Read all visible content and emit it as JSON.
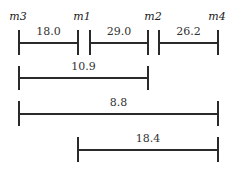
{
  "diagram": {
    "markers": [
      {
        "name": "m3",
        "x": 18
      },
      {
        "name": "m1",
        "x": 82
      },
      {
        "name": "m2",
        "x": 153
      },
      {
        "name": "m4",
        "x": 217
      }
    ],
    "intervals": [
      {
        "from": "m3",
        "to": "m1",
        "label": "18.0",
        "x1": 18,
        "x2": 77,
        "y": 42,
        "tickTop": 30,
        "tickBottom": 55,
        "labelY": 26
      },
      {
        "from": "m1",
        "to": "m2",
        "label": "29.0",
        "x1": 89,
        "x2": 147,
        "y": 42,
        "tickTop": 30,
        "tickBottom": 55,
        "labelY": 26
      },
      {
        "from": "m2",
        "to": "m4",
        "label": "26.2",
        "x1": 158,
        "x2": 217,
        "y": 42,
        "tickTop": 30,
        "tickBottom": 55,
        "labelY": 26
      },
      {
        "from": "m3",
        "to": "m2",
        "label": "10.9",
        "x1": 18,
        "x2": 147,
        "y": 77,
        "tickTop": 66,
        "tickBottom": 90,
        "labelY": 61
      },
      {
        "from": "m3",
        "to": "m4",
        "label": "8.8",
        "x1": 18,
        "x2": 217,
        "y": 113,
        "tickTop": 101,
        "tickBottom": 126,
        "labelY": 97
      },
      {
        "from": "m1",
        "to": "m4",
        "label": "18.4",
        "x1": 77,
        "x2": 217,
        "y": 149,
        "tickTop": 137,
        "tickBottom": 162,
        "labelY": 133
      }
    ]
  }
}
